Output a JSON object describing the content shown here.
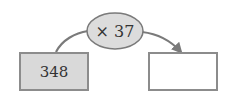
{
  "diagram": {
    "input_value": "348",
    "operation": "× 37",
    "output_value": "",
    "colors": {
      "input_box_fill": "#d9d9d9",
      "box_stroke": "#8c8c8c",
      "ellipse_fill": "#dcdcdc",
      "ellipse_stroke": "#7a7a7a",
      "arrow": "#7a7a7a"
    }
  }
}
